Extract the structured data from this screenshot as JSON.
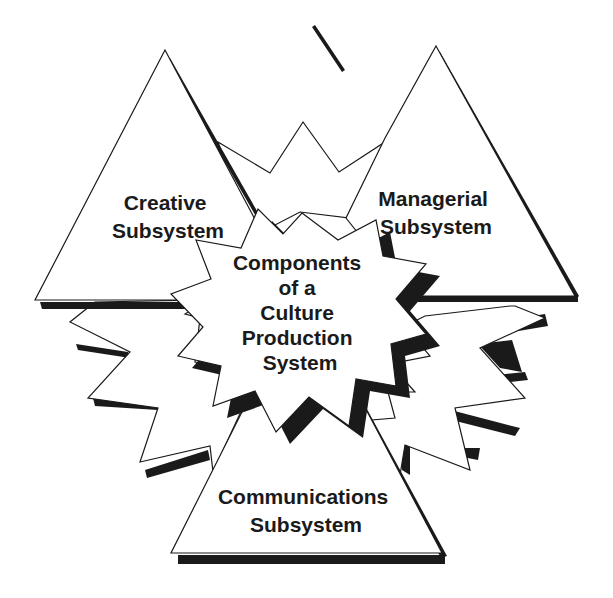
{
  "diagram": {
    "title": "Components of a Culture Production System",
    "center": {
      "lines": [
        "Components",
        "of a",
        "Culture",
        "Production",
        "System"
      ]
    },
    "subsystems": [
      {
        "id": "creative",
        "lines": [
          "Creative",
          "Subsystem"
        ]
      },
      {
        "id": "managerial",
        "lines": [
          "Managerial",
          "Subsystem"
        ]
      },
      {
        "id": "communications",
        "lines": [
          "Communications",
          "Subsystem"
        ]
      }
    ],
    "colors": {
      "stroke": "#1a1a1a",
      "fill": "#ffffff",
      "shadow": "#1a1a1a",
      "background": "#ffffff"
    }
  }
}
